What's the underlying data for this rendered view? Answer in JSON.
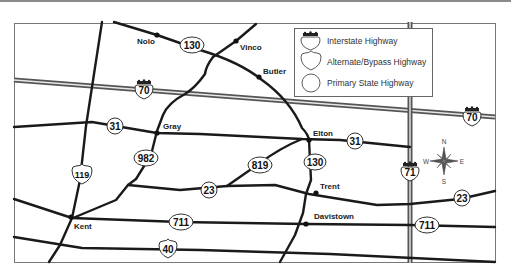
{
  "map": {
    "legend": {
      "items": [
        {
          "symbol": "interstate-shield",
          "label": "Interstate Highway"
        },
        {
          "symbol": "bypass-shield",
          "label": "Alternate/Bypass Highway"
        },
        {
          "symbol": "state-circle",
          "label": "Primary State Highway"
        }
      ]
    },
    "towns": [
      {
        "name": "Nolo"
      },
      {
        "name": "Vinco"
      },
      {
        "name": "Butler"
      },
      {
        "name": "Gray"
      },
      {
        "name": "Elton"
      },
      {
        "name": "Trent"
      },
      {
        "name": "Kent"
      },
      {
        "name": "Davistown"
      }
    ],
    "highways": {
      "interstate": [
        "70",
        "70",
        "71"
      ],
      "bypass": [
        "119",
        "40"
      ],
      "state": [
        "130",
        "31",
        "31",
        "982",
        "819",
        "130",
        "23",
        "23",
        "711",
        "711"
      ]
    },
    "compass": {
      "n": "N",
      "s": "S",
      "e": "E",
      "w": "W"
    }
  }
}
